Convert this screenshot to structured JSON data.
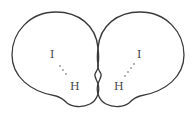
{
  "figure": {
    "left_molecule": {
      "atoms": [
        {
          "label": "I",
          "x": 52,
          "y": 57
        },
        {
          "label": "H",
          "x": 74,
          "y": 89
        }
      ],
      "bond_style": "dotted"
    },
    "right_molecule": {
      "atoms": [
        {
          "label": "I",
          "x": 140,
          "y": 57
        },
        {
          "label": "H",
          "x": 117,
          "y": 89
        }
      ],
      "bond_style": "dotted"
    },
    "colors": {
      "outline": "#3a3a3a",
      "label": "#444444",
      "background": "#ffffff"
    }
  }
}
